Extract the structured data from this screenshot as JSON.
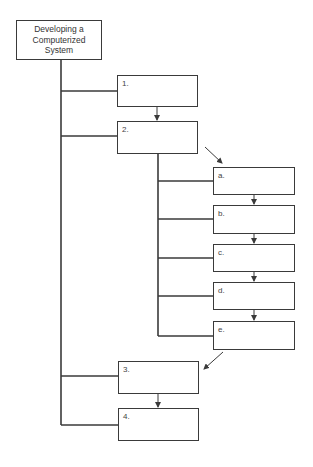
{
  "diagram": {
    "title_lines": [
      "Developing a",
      "Computerized",
      "System"
    ],
    "main_steps": [
      {
        "label": "1."
      },
      {
        "label": "2."
      },
      {
        "label": "3."
      },
      {
        "label": "4."
      }
    ],
    "sub_steps": [
      {
        "label": "a."
      },
      {
        "label": "b."
      },
      {
        "label": "c."
      },
      {
        "label": "d."
      },
      {
        "label": "e."
      }
    ],
    "line_color": "#3a3a3a"
  }
}
